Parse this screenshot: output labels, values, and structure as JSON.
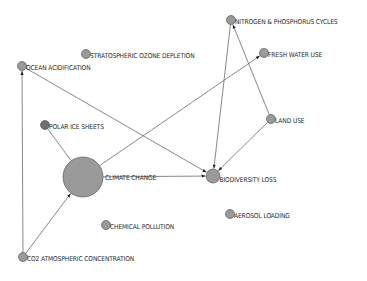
{
  "diagram": {
    "type": "network-graph",
    "colors": {
      "node_fill": "#9a9a9a",
      "node_fill_dark": "#6e6e6e",
      "node_stroke": "#5a5a5a",
      "edge": "#6a6a6a",
      "label": "#2a2a2a"
    },
    "nodes": [
      {
        "id": "nitrogen",
        "label": "NITROGEN & PHOSPHORUS CYCLES",
        "size": "small",
        "shade": "normal"
      },
      {
        "id": "ozone",
        "label": "STRATOSPHERIC OZONE DEPLETION",
        "size": "small",
        "shade": "normal"
      },
      {
        "id": "freshwater",
        "label": "FRESH WATER USE",
        "size": "small",
        "shade": "normal"
      },
      {
        "id": "ocean",
        "label": "OCEAN ACIDIFICATION",
        "size": "small",
        "shade": "normal"
      },
      {
        "id": "polar",
        "label": "POLAR ICE SHEETS",
        "size": "small",
        "shade": "dark"
      },
      {
        "id": "landuse",
        "label": "LAND USE",
        "size": "small",
        "shade": "normal"
      },
      {
        "id": "climate",
        "label": "CLIMATE CHANGE",
        "size": "large",
        "shade": "normal"
      },
      {
        "id": "biodiversity",
        "label": "BIODIVERSITY LOSS",
        "size": "medium",
        "shade": "normal"
      },
      {
        "id": "chemical",
        "label": "CHEMICAL POLLUTION",
        "size": "small",
        "shade": "normal"
      },
      {
        "id": "aerosol",
        "label": "AEROSOL LOADING",
        "size": "small",
        "shade": "normal"
      },
      {
        "id": "co2",
        "label": "CO2 ATMOSPHERIC CONCENTRATION",
        "size": "small",
        "shade": "normal"
      }
    ],
    "edges": [
      {
        "from": "co2",
        "to": "climate",
        "directed": true
      },
      {
        "from": "co2",
        "to": "ocean",
        "directed": true
      },
      {
        "from": "ocean",
        "to": "biodiversity",
        "directed": true
      },
      {
        "from": "polar",
        "to": "climate",
        "directed": false
      },
      {
        "from": "climate",
        "to": "freshwater",
        "directed": true
      },
      {
        "from": "climate",
        "to": "biodiversity",
        "directed": true
      },
      {
        "from": "nitrogen",
        "to": "biodiversity",
        "directed": true
      },
      {
        "from": "landuse",
        "to": "nitrogen",
        "directed": true
      },
      {
        "from": "landuse",
        "to": "biodiversity",
        "directed": true
      }
    ]
  }
}
